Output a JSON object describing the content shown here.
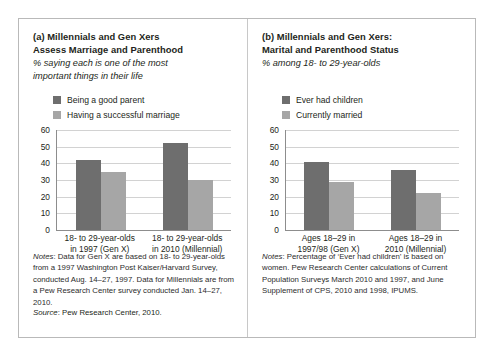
{
  "figure": {
    "colors": {
      "series1": "#6e6e6e",
      "series2": "#a6a6a6",
      "gridline": "#d2d2d2",
      "axis": "#8d8d8d",
      "frame": "#b9b9b9",
      "text": "#231f20"
    }
  },
  "panel_a": {
    "title": "(a) Millennials and Gen Xers Assess Marriage and Parenthood",
    "title_line1": "(a) Millennials and Gen Xers",
    "title_line2": "Assess Marriage and Parenthood",
    "subtitle_line1": "% saying each is one of the most",
    "subtitle_line2": "important things in their life",
    "legend": [
      {
        "label": "Being a good parent",
        "color": "#6e6e6e"
      },
      {
        "label": "Having a successful marriage",
        "color": "#a6a6a6"
      }
    ],
    "notes_lead": "Notes",
    "notes_text": ": Data for Gen X are based on 18- to 29-year-olds from a 1997 Washington Post Kaiser/Harvard Survey, conducted Aug. 14–27, 1997. Data for Millennials are from a Pew Research Center survey conducted Jan. 14–27, 2010.",
    "source_lead": "Source",
    "source_text": ": Pew Research Center, 2010.",
    "chart_data": {
      "type": "bar",
      "title": "(a) Millennials and Gen Xers Assess Marriage and Parenthood",
      "subtitle": "% saying each is one of the most important things in their life",
      "categories": [
        "18- to 29-year-olds in 1997 (Gen X)",
        "18- to 29-year-olds in 2010 (Millennial)"
      ],
      "category_lines": [
        [
          "18- to 29-year-olds",
          "in 1997 (Gen X)"
        ],
        [
          "18- to 29-year-olds",
          "in 2010 (Millennial)"
        ]
      ],
      "series": [
        {
          "name": "Being a good parent",
          "values": [
            42,
            52
          ],
          "color": "#6e6e6e"
        },
        {
          "name": "Having a successful marriage",
          "values": [
            35,
            30
          ],
          "color": "#a6a6a6"
        }
      ],
      "xlabel": "",
      "ylabel": "",
      "ylim": [
        0,
        60
      ],
      "yticks": [
        0,
        10,
        20,
        30,
        40,
        50,
        60
      ],
      "grid": true,
      "legend_position": "top-left"
    }
  },
  "panel_b": {
    "title": "(b) Millennials and Gen Xers: Marital and Parenthood Status",
    "title_line1": "(b) Millennials and Gen Xers:",
    "title_line2": "Marital and Parenthood Status",
    "subtitle_line1": "% among 18- to 29-year-olds",
    "subtitle_line2": "",
    "legend": [
      {
        "label": "Ever had children",
        "color": "#6e6e6e"
      },
      {
        "label": "Currently married",
        "color": "#a6a6a6"
      }
    ],
    "notes_lead": "Notes",
    "notes_text": ": Percentage of ‘Ever had children’ is based on women. Pew Research Center calculations of Current Population Surveys March 2010 and 1997, and June Supplement of CPS, 2010 and 1998, IPUMS.",
    "chart_data": {
      "type": "bar",
      "title": "(b) Millennials and Gen Xers: Marital and Parenthood Status",
      "subtitle": "% among 18- to 29-year-olds",
      "categories": [
        "Ages 18–29 in 1997/98 (Gen X)",
        "Ages 18–29 in 2010 (Millennial)"
      ],
      "category_lines": [
        [
          "Ages 18–29 in",
          "1997/98 (Gen X)"
        ],
        [
          "Ages 18–29 in",
          "2010 (Millennial)"
        ]
      ],
      "series": [
        {
          "name": "Ever had children",
          "values": [
            41,
            36
          ],
          "color": "#6e6e6e"
        },
        {
          "name": "Currently married",
          "values": [
            29,
            22
          ],
          "color": "#a6a6a6"
        }
      ],
      "xlabel": "",
      "ylabel": "",
      "ylim": [
        0,
        60
      ],
      "yticks": [
        0,
        10,
        20,
        30,
        40,
        50,
        60
      ],
      "grid": true,
      "legend_position": "top-left"
    }
  }
}
